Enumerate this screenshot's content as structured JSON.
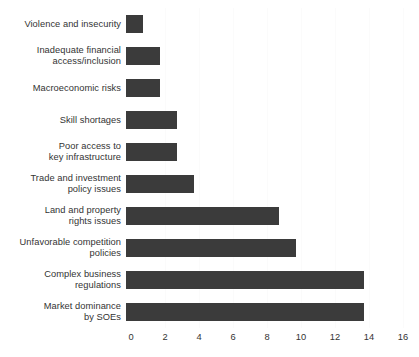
{
  "chart_data": {
    "type": "bar",
    "orientation": "horizontal",
    "title": "",
    "subtitle": "",
    "xlabel": "",
    "ylabel": "",
    "xlim": [
      0,
      16
    ],
    "xticks": [
      0,
      2,
      4,
      6,
      8,
      10,
      12,
      14,
      16
    ],
    "xtick_labels": [
      "0",
      "2",
      "4",
      "6",
      "8",
      "10",
      "12",
      "14",
      "16"
    ],
    "grid": true,
    "legend": null,
    "legend_position": "none",
    "bar_color": "#3b3b3b",
    "background_color": "#ffffff",
    "text_color": "#333333",
    "categories": [
      "Violence and insecurity",
      "Inadequate financial\naccess/inclusion",
      "Macroeconomic risks",
      "Skill shortages",
      "Poor access to\nkey infrastructure",
      "Trade and investment\npolicy issues",
      "Land and property\nrights issues",
      "Unfavorable competition\npolicies",
      "Complex business\nregulations",
      "Market dominance\nby SOEs"
    ],
    "values": [
      1,
      2,
      2,
      3,
      3,
      4,
      9,
      10,
      14,
      14
    ],
    "series": [
      {
        "name": "Count",
        "values": [
          1,
          2,
          2,
          3,
          3,
          4,
          9,
          10,
          14,
          14
        ]
      }
    ]
  }
}
